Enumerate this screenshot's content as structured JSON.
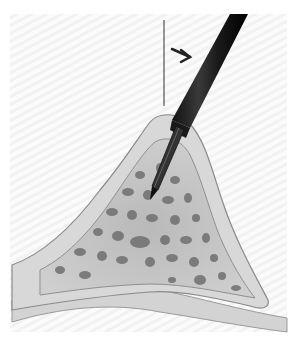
{
  "illustration": {
    "subject": "bone biopsy needle inserted through cortical bone into cancellous bone",
    "background_color": "#f4f4f4",
    "bone_color": "#c9c9c9",
    "cortex_color": "#d6d6d6",
    "needle_color": "#2a2a2a",
    "arrow_direction": "down-right",
    "pointer_line": true
  }
}
